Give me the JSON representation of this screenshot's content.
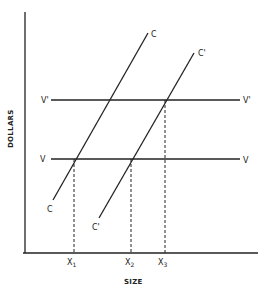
{
  "diagram": {
    "y_axis_label": "DOLLARS",
    "x_axis_label": "SIZE",
    "lines": {
      "C": {
        "label_top": "C",
        "label_bottom": "C"
      },
      "C_prime": {
        "label_top": "C'",
        "label_bottom": "C'"
      },
      "V": {
        "label_left": "V",
        "label_right": "V"
      },
      "V_prime": {
        "label_left": "V'",
        "label_right": "V'"
      }
    },
    "x_ticks": [
      {
        "base": "X",
        "sub": "1"
      },
      {
        "base": "X",
        "sub": "2"
      },
      {
        "base": "X",
        "sub": "3"
      }
    ],
    "colors": {
      "ink": "#222222",
      "background": "#ffffff"
    }
  }
}
